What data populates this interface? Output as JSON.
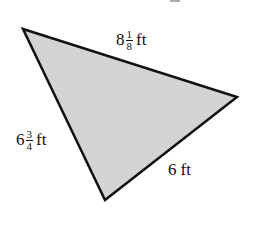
{
  "figure": {
    "type": "triangle",
    "fill_color": "#d6d6d6",
    "stroke_color": "#111111",
    "stroke_width": 2.5,
    "vertices": {
      "top_left": {
        "x": 23,
        "y": 29
      },
      "right": {
        "x": 237,
        "y": 97
      },
      "bottom": {
        "x": 105,
        "y": 200
      }
    }
  },
  "labels": {
    "top_side": {
      "whole": "8",
      "numerator": "1",
      "denominator": "8",
      "unit": "ft"
    },
    "left_side": {
      "whole": "6",
      "numerator": "3",
      "denominator": "4",
      "unit": "ft"
    },
    "bottom_right_side": {
      "whole": "6",
      "unit": "ft"
    }
  }
}
